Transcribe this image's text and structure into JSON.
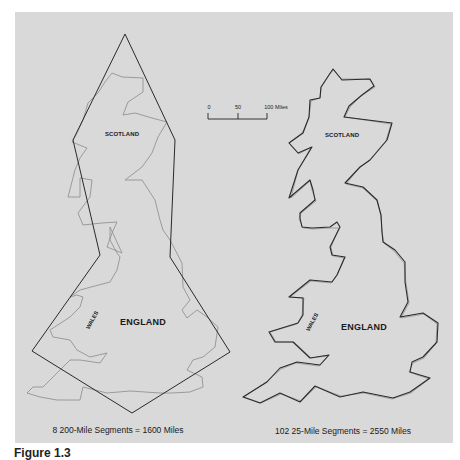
{
  "figure": {
    "background_color": "#d9d9d9",
    "coast_color": "#8a8a8a",
    "segment_color": "#2a2a2a",
    "scale_bar": {
      "ticks": [
        "0",
        "50",
        "100 Miles"
      ]
    },
    "left_map": {
      "labels": {
        "scotland": "SCOTLAND",
        "wales": "WALES",
        "england": "ENGLAND"
      },
      "caption": "8 200-Mile Segments = 1600 Miles",
      "segment_count": 8,
      "segment_length_miles": 200,
      "total_miles": 1600
    },
    "right_map": {
      "labels": {
        "scotland": "SCOTLAND",
        "wales": "WALES",
        "england": "ENGLAND"
      },
      "caption": "102 25-Mile Segments = 2550 Miles",
      "segment_count": 102,
      "segment_length_miles": 25,
      "total_miles": 2550
    },
    "bottom_caption_fragment": "Figure 1.3"
  }
}
